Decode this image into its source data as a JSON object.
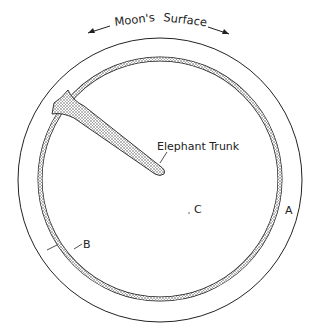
{
  "diagram": {
    "title": "Moon's Surface",
    "labels": {
      "trunk": "Elephant Trunk",
      "a": "A",
      "b": "B",
      "c": "C"
    },
    "colors": {
      "ink": "#222222",
      "background": "#ffffff"
    }
  }
}
